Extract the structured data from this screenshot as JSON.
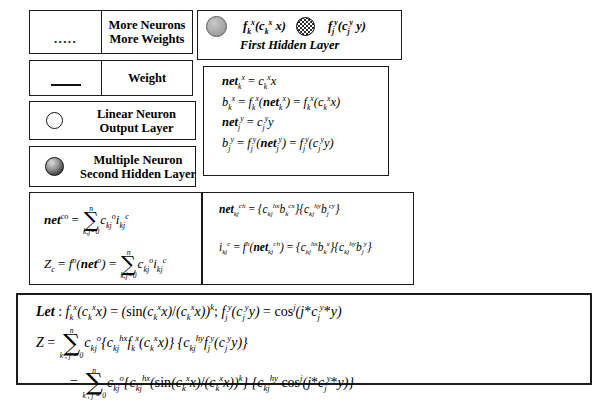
{
  "figure": {
    "background": "#ffffff",
    "ink_color": "#1a1a1a"
  },
  "legend": {
    "name": "legend-panel",
    "items": [
      {
        "id": "more-neurons",
        "icon": "dotted-line-icon",
        "icon_glyph": ".....",
        "label_line1": "More Neurons",
        "label_line2": "More Weights"
      },
      {
        "id": "weight",
        "icon": "solid-line-icon",
        "icon_glyph": "—",
        "label_line1": "Weight",
        "label_line2": ""
      },
      {
        "id": "linear-neuron",
        "icon": "open-circle-icon",
        "icon_glyph": "○",
        "label_line1": "Linear Neuron",
        "label_line2": "Output Layer"
      },
      {
        "id": "multiple-neuron",
        "icon": "shaded-circle-icon",
        "icon_glyph": "●",
        "label_line1": "Multiple Neuron",
        "label_line2": "Second Hidden Layer"
      }
    ]
  },
  "first_hidden_layer": {
    "name": "first-hidden-layer-panel",
    "icon_left": "gray-circle-icon",
    "icon_mid": "hatched-circle-icon",
    "formula_left": "f k^x ( c k^x x )",
    "formula_right": "f j^y ( c j^y y )",
    "caption": "First Hidden Layer"
  },
  "activation_equations": {
    "name": "activation-equations-panel",
    "lines": [
      "net_k^x = c_k^x x",
      "b_k^x = f_k^x ( net_k^x ) = f_k^x ( c_k^x x )",
      "net_j^y = c_j^y y",
      "b_j^y = f_j^y ( net_j^y ) = f_j^y ( c_j^y y )"
    ]
  },
  "output_equations": {
    "name": "output-equations-panel",
    "lines": [
      "net^co = SUM_{k,j=0}^{n} c_kj^o i_kj^c",
      "Z_c = f^o ( net^o ) = SUM_{k,j=0}^{n} c_kj^o i_kj^c"
    ],
    "sum_upper": "n",
    "sum_lower": "k,j=0"
  },
  "hidden_equations": {
    "name": "hidden-equations-panel",
    "lines": [
      "net_kj^ch = { c_kj^hx b_k^cx } { c_kj^hy b_j^cy }",
      "i_kj^c = f^h ( net_kj^ch ) = { c_kj^hx b_k^x } { c_kj^hy b_j^y }"
    ]
  },
  "derivation": {
    "name": "derivation-panel",
    "sum_upper": "n",
    "sum_lower": "k , j = 0",
    "line1_prefix": "Let :",
    "line1": "f_k^x ( c_k^x x ) = ( sin( c_k^x x ) / ( c_k^x x ) )^k ; f_j^y ( c_j^y y ) = cos^j ( j * c_j^y * y )",
    "line2": "Z = SUM c_kj^o { c_kj^hx f_k^x ( c_k^x x ) } { c_kj^hy f_j^y ( c_j^y y ) }",
    "line3": "= SUM c_kj^o { c_kj^hx ( sin( c_k^x x ) / ( c_k^x x ) )^k } { c_kj^hy cos^j ( j * c_j^y * y ) }"
  }
}
